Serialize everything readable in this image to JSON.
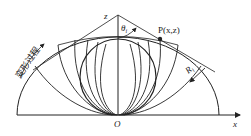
{
  "figure": {
    "axis_labels": {
      "z": "z",
      "x": "x",
      "origin": "O"
    },
    "angle_label": "θ",
    "angle_subscript": "i",
    "point_label": "P(x,z)",
    "radius_label": "R",
    "radius_subscript": "i",
    "process_label": "变形过程",
    "colors": {
      "line": "#222222",
      "background": "#ffffff"
    }
  }
}
